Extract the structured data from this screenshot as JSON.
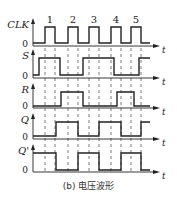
{
  "caption": "(b) 电压波形",
  "axis_label": "t",
  "zero_label": "0",
  "clock_pulse_labels": [
    "1",
    "2",
    "3",
    "4",
    "5"
  ],
  "colors": {
    "line": "#222222",
    "dash": "#444444",
    "background": "#ffffff"
  },
  "signals": [
    {
      "name": "CLK",
      "levels": [
        [
          33,
          0
        ],
        [
          45,
          1
        ],
        [
          55,
          0
        ],
        [
          68,
          1
        ],
        [
          78,
          0
        ],
        [
          89,
          1
        ],
        [
          99,
          0
        ],
        [
          111,
          1
        ],
        [
          121,
          0
        ],
        [
          131,
          1
        ],
        [
          141,
          0
        ]
      ],
      "base": 43,
      "high": 27,
      "axis": 46
    },
    {
      "name": "S",
      "levels": [
        [
          33,
          0
        ],
        [
          39,
          1
        ],
        [
          60,
          0
        ],
        [
          83,
          1
        ],
        [
          114,
          0
        ],
        [
          139,
          1
        ]
      ],
      "base": 75,
      "high": 58,
      "axis": 78
    },
    {
      "name": "R",
      "levels": [
        [
          33,
          0
        ],
        [
          61,
          1
        ],
        [
          83,
          0
        ],
        [
          117,
          1
        ],
        [
          134,
          0
        ]
      ],
      "base": 106,
      "high": 92,
      "axis": 108
    },
    {
      "name": "Q",
      "levels": [
        [
          33,
          0
        ],
        [
          56,
          1
        ],
        [
          78,
          0
        ],
        [
          99,
          1
        ],
        [
          121,
          0
        ],
        [
          141,
          1
        ]
      ],
      "base": 136,
      "high": 122,
      "axis": 139
    },
    {
      "name": "Q'",
      "levels": [
        [
          33,
          1
        ],
        [
          56,
          0
        ],
        [
          78,
          1
        ],
        [
          99,
          0
        ],
        [
          121,
          1
        ],
        [
          141,
          0
        ]
      ],
      "base": 170,
      "high": 153,
      "axis": 172
    }
  ],
  "dashed_lines_x": [
    45,
    55,
    68,
    78,
    89,
    99,
    111,
    121,
    131,
    141
  ],
  "x_end": 150,
  "arrow_end": 160
}
